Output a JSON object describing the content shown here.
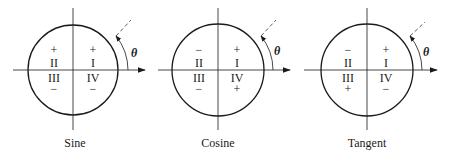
{
  "figure": {
    "colors": {
      "ink": "#1a1a1a",
      "background": "#ffffff"
    },
    "angle_label": "θ",
    "quadrant_labels": {
      "I": "I",
      "II": "II",
      "III": "III",
      "IV": "IV"
    },
    "diagrams": [
      {
        "caption": "Sine",
        "center_x": 73,
        "signs": {
          "I": "+",
          "II": "+",
          "III": "−",
          "IV": "−"
        }
      },
      {
        "caption": "Cosine",
        "center_x": 218,
        "signs": {
          "I": "+",
          "II": "−",
          "III": "−",
          "IV": "+"
        }
      },
      {
        "caption": "Tangent",
        "center_x": 367,
        "signs": {
          "I": "+",
          "II": "−",
          "III": "+",
          "IV": "−"
        }
      }
    ]
  }
}
